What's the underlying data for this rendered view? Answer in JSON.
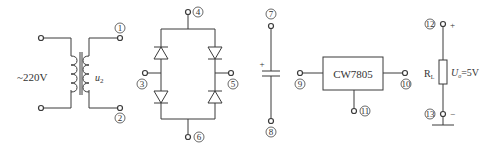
{
  "diagram": {
    "type": "circuit-components",
    "colors": {
      "line": "#3a3a3a",
      "text": "#333333",
      "background": "#ffffff"
    },
    "transformer": {
      "primary_label": "~220V",
      "secondary_label": "u",
      "secondary_subscript": "2",
      "terminals": [
        "1",
        "2"
      ]
    },
    "bridge_rectifier": {
      "terminals": [
        "3",
        "4",
        "5",
        "6"
      ],
      "diodes": 4
    },
    "capacitor": {
      "polarity": "+",
      "terminals": [
        "7",
        "8"
      ]
    },
    "regulator": {
      "label": "CW7805",
      "terminals": [
        "9",
        "10",
        "11"
      ]
    },
    "load": {
      "resistor_label": "R",
      "resistor_subscript": "L",
      "voltage_label": "U",
      "voltage_subscript": "o",
      "voltage_value": "=5V",
      "plus": "+",
      "minus": "−",
      "terminals": [
        "12",
        "13"
      ]
    }
  }
}
